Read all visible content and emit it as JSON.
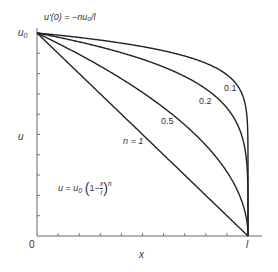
{
  "diagram": {
    "axis_labels": {
      "x": "x",
      "y": "u"
    },
    "origin_label": "0",
    "x_end_label": "l",
    "y_start_label": "u",
    "y_start_sub": "0",
    "slope_annotation": "u'(0) = −nu₀/l",
    "formula": {
      "lhs": "u = u",
      "sub": "0",
      "paren_open": "(",
      "one_minus": "1−",
      "num": "x",
      "den": "l",
      "paren_close": ")",
      "exp": "n"
    },
    "curve_labels": [
      {
        "n": "0.1",
        "label": "0.1"
      },
      {
        "n": "0.2",
        "label": "0.2"
      },
      {
        "n": "0.5",
        "label": "0.5"
      },
      {
        "n": "1",
        "label": "n = 1"
      }
    ],
    "colors": {
      "line": "#222222",
      "axis": "#555555",
      "text": "#333333"
    }
  }
}
